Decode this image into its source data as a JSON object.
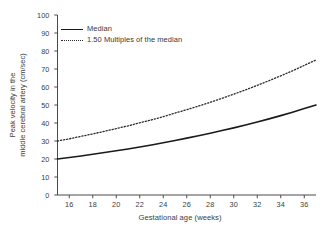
{
  "chart_data": {
    "type": "line",
    "title": "",
    "xlabel": "Gestational age (weeks)",
    "ylabel_line1": "Peak velocity in the",
    "ylabel_line2": "middle cerebral artery (cm/sec)",
    "xlim": [
      15,
      37
    ],
    "ylim": [
      0,
      100
    ],
    "grid": false,
    "legend_position": "top-left",
    "xticks": [
      16,
      18,
      20,
      22,
      24,
      26,
      28,
      30,
      32,
      34,
      36
    ],
    "xtick_labels": [
      "16",
      "18",
      "20",
      "22",
      "24",
      "26",
      "28",
      "30",
      "32",
      "34",
      "36"
    ],
    "yticks": [
      0,
      10,
      20,
      30,
      40,
      50,
      60,
      70,
      80,
      90,
      100
    ],
    "ytick_labels": [
      "0",
      "10",
      "20",
      "30",
      "40",
      "50",
      "60",
      "70",
      "80",
      "90",
      "100"
    ],
    "x": [
      15,
      16,
      17,
      18,
      19,
      20,
      21,
      22,
      23,
      24,
      25,
      26,
      27,
      28,
      29,
      30,
      31,
      32,
      33,
      34,
      35,
      36,
      37
    ],
    "series": [
      {
        "name": "Median",
        "style": "solid",
        "color": "#1a1a1a",
        "values": [
          20.0,
          20.8,
          21.7,
          22.6,
          23.6,
          24.6,
          25.6,
          26.7,
          27.8,
          29.0,
          30.3,
          31.6,
          32.9,
          34.3,
          35.8,
          37.3,
          38.9,
          40.6,
          42.3,
          44.1,
          46.0,
          48.0,
          50.0
        ]
      },
      {
        "name": "1.50 Multiples of the median",
        "style": "dotted",
        "color": "#2b2b2b",
        "values": [
          30.0,
          31.2,
          32.6,
          33.9,
          35.4,
          36.9,
          38.4,
          40.1,
          41.7,
          43.5,
          45.5,
          47.4,
          49.4,
          51.5,
          53.7,
          56.0,
          58.4,
          60.9,
          63.5,
          66.2,
          69.0,
          72.0,
          75.0
        ]
      }
    ]
  },
  "legend": {
    "entries": [
      {
        "label": "Median"
      },
      {
        "label": "1.50 Multiples of the median"
      }
    ]
  },
  "axes": {
    "y_title_line1": "Peak velocity in the",
    "y_title_line2": "middle cerebral artery (cm/sec)",
    "x_title": "Gestational age (weeks)"
  },
  "colors": {
    "background": "#ffffff",
    "axis": "#4a4a4a",
    "median_line": "#1a1a1a",
    "mom_line": "#2b2b2b",
    "text": "#3a3a3a"
  }
}
